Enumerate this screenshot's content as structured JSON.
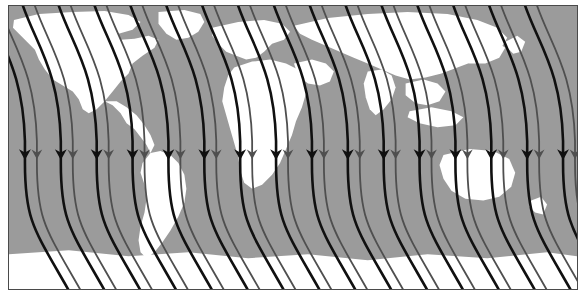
{
  "figure": {
    "kind": "map-figure",
    "title": "",
    "caption": "",
    "width_px": 587,
    "height_px": 306
  },
  "panel": {
    "name": "map-panel",
    "frame_color": "#4a4a4a",
    "frame_width_px": 1.5,
    "page_background": "#ffffff"
  },
  "map": {
    "projection": "equirectangular",
    "ocean_color": "#9b9b9b",
    "land_color": "#ffffff",
    "lon_range": [
      -180,
      180
    ],
    "lat_range": [
      -90,
      90
    ],
    "graticule": false,
    "land_polygons": [
      {
        "name": "north-america",
        "points": "5,14 30,8 64,6 96,5 120,9 132,16 124,24 110,28 112,34 126,33 140,30 150,34 146,42 134,50 124,58 120,68 112,76 104,86 96,96 88,104 80,108 74,104 70,94 64,86 54,80 44,74 36,64 30,54 26,44 18,36 10,28 4,22"
      },
      {
        "name": "central-america",
        "points": "96,96 104,100 112,108 118,118 126,124 132,132 138,140 142,148 146,140 142,130 136,120 128,110 118,102 108,96"
      },
      {
        "name": "south-america",
        "points": "142,148 152,146 162,150 170,158 176,170 178,184 176,198 170,212 162,226 154,238 146,248 138,254 132,248 130,236 132,222 136,208 138,194 136,180 132,168 134,158"
      },
      {
        "name": "greenland",
        "points": "150,6 176,4 192,8 196,16 190,26 180,32 168,34 158,28 150,18"
      },
      {
        "name": "europe",
        "points": "204,22 230,16 256,14 274,18 282,26 276,34 264,38 256,46 248,52 238,54 228,50 218,46 210,38 204,30"
      },
      {
        "name": "africa",
        "points": "226,62 244,56 262,54 278,58 290,64 296,74 298,88 294,102 288,116 284,130 278,144 272,158 264,170 254,180 244,184 236,178 232,166 230,152 226,138 222,124 218,110 214,96 216,82 220,70"
      },
      {
        "name": "middle-east",
        "points": "286,58 304,54 318,58 326,66 322,76 312,80 300,78 290,70"
      },
      {
        "name": "asia",
        "points": "286,20 320,12 360,8 400,6 440,8 470,14 490,22 500,32 494,42 480,50 466,56 450,62 434,68 418,72 402,74 388,70 374,64 360,58 346,52 332,46 318,40 304,34 292,28"
      },
      {
        "name": "india",
        "points": "360,66 374,64 384,70 388,82 384,94 376,104 368,110 362,104 358,92 356,78"
      },
      {
        "name": "se-asia",
        "points": "398,78 416,74 430,78 438,86 432,96 420,100 408,98 398,90"
      },
      {
        "name": "east-asia",
        "points": "440,34 466,30 486,34 498,42 492,52 478,58 462,58 448,52 440,44"
      },
      {
        "name": "indonesia",
        "points": "402,106 424,102 444,106 456,112 448,120 430,122 412,118 400,112"
      },
      {
        "name": "australia",
        "points": "436,150 462,144 486,146 502,154 508,168 504,182 492,192 476,196 458,194 444,186 436,174 432,160"
      },
      {
        "name": "new-zealand",
        "points": "524,196 534,192 540,200 536,210 528,208 522,202"
      },
      {
        "name": "japan",
        "points": "498,36 510,30 518,36 514,46 506,48 500,42"
      },
      {
        "name": "antarctic-fringe",
        "points": "0,250 60,246 120,252 180,248 240,254 300,250 360,256 420,250 480,254 540,248 570,252 570,285 0,285"
      }
    ]
  },
  "flow_field": {
    "name": "trajectory-arrows",
    "description": "Streamline trajectories arcing from upper-left, descending vertically with mid-panel arrowheads, then curving toward lower-right",
    "line_color_dark": "#101010",
    "line_color_light": "#4f4f4f",
    "line_width_dark_px": 2.6,
    "line_width_light_px": 1.8,
    "arrowhead_y_px": 148,
    "arrowhead_size_px": 7,
    "pair_spacing_px": 36,
    "intra_pair_spacing_px": 12,
    "pair_count": 16,
    "first_pair_x_px": 16,
    "curve": {
      "top_entry_dx_px": -40,
      "top_entry_y_px": -6,
      "bottom_exit_dx_px": 46,
      "bottom_exit_y_px": 290
    }
  }
}
